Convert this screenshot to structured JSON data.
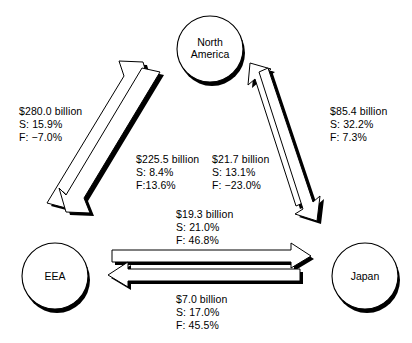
{
  "diagram": {
    "background": "#ffffff",
    "ink": "#000000",
    "nodes": [
      {
        "id": "north-america",
        "label_line1": "North",
        "label_line2": "America"
      },
      {
        "id": "eea",
        "label_line1": "EEA",
        "label_line2": ""
      },
      {
        "id": "japan",
        "label_line1": "Japan",
        "label_line2": ""
      }
    ],
    "flows": [
      {
        "id": "eea-to-north-america",
        "from": "EEA",
        "to": "North America",
        "amount": "$280.0 billion",
        "share": "S: 15.9%",
        "growth": "F: −7.0%"
      },
      {
        "id": "north-america-to-eea",
        "from": "North America",
        "to": "EEA",
        "amount": "$225.5 billion",
        "share": "S: 8.4%",
        "growth": "F:13.6%"
      },
      {
        "id": "japan-to-north-america",
        "from": "Japan",
        "to": "North America",
        "amount": "$85.4 billion",
        "share": "S: 32.2%",
        "growth": "F: 7.3%"
      },
      {
        "id": "north-america-to-japan",
        "from": "North America",
        "to": "Japan",
        "amount": "$21.7 billion",
        "share": "S: 13.1%",
        "growth": "F: −23.0%"
      },
      {
        "id": "eea-to-japan",
        "from": "EEA",
        "to": "Japan",
        "amount": "$19.3 billion",
        "share": "S: 21.0%",
        "growth": "F: 46.8%"
      },
      {
        "id": "japan-to-eea",
        "from": "Japan",
        "to": "EEA",
        "amount": "$7.0 billion",
        "share": "S: 17.0%",
        "growth": "F: 45.5%"
      }
    ]
  }
}
